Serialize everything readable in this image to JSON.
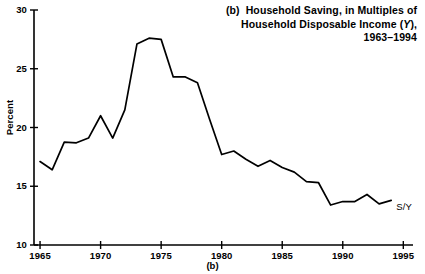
{
  "figure": {
    "panel_caption": "(b)",
    "title_lines": [
      "(b)  Household Saving, in Multiples of",
      "Household Disposable Income (Y),",
      "1963–1994"
    ],
    "title_line1_prefix": "(b)",
    "title_line1_rest": "Household Saving, in Multiples of",
    "title_line2_a": "Household Disposable Income (",
    "title_line2_italic": "Y",
    "title_line2_b": "),",
    "title_line3": "1963–1994",
    "series_label": "S/Y",
    "line_color": "#000000",
    "axis_color": "#000000",
    "background": "#ffffff"
  },
  "chart_data": {
    "type": "line",
    "xlabel": "",
    "ylabel": "Percent",
    "xlim": [
      1964.5,
      1995.8
    ],
    "ylim": [
      10,
      30
    ],
    "grid": false,
    "legend": "inline-right",
    "xticks": [
      1965,
      1970,
      1975,
      1980,
      1985,
      1990,
      1995
    ],
    "xtick_labels": [
      "1965",
      "1970",
      "1975",
      "1980",
      "1985",
      "1990",
      "1995"
    ],
    "yticks": [
      10,
      15,
      20,
      25,
      30
    ],
    "ytick_labels": [
      "10",
      "15",
      "20",
      "25",
      "30"
    ],
    "series": [
      {
        "name": "S/Y",
        "x": [
          1965,
          1966,
          1967,
          1968,
          1969,
          1970,
          1971,
          1972,
          1973,
          1974,
          1975,
          1976,
          1977,
          1978,
          1979,
          1980,
          1981,
          1982,
          1983,
          1984,
          1985,
          1986,
          1987,
          1988,
          1989,
          1990,
          1991,
          1992,
          1993,
          1994
        ],
        "values": [
          17.1,
          16.4,
          18.75,
          18.7,
          19.1,
          21.0,
          19.1,
          21.5,
          27.1,
          27.6,
          27.5,
          24.3,
          24.3,
          23.8,
          20.7,
          17.7,
          18.0,
          17.3,
          16.7,
          17.2,
          16.6,
          16.2,
          15.4,
          15.3,
          13.4,
          13.7,
          13.7,
          14.3,
          13.5,
          13.8
        ]
      }
    ]
  }
}
